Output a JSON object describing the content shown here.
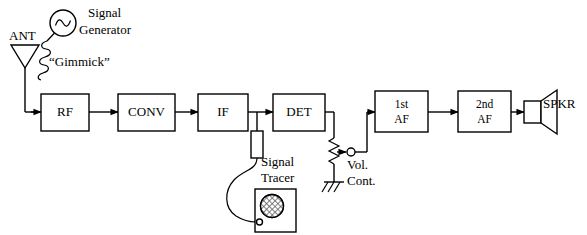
{
  "diagram": {
    "blocks": [
      {
        "id": "rf",
        "label": "RF",
        "label2": "",
        "x": 41,
        "y": 94,
        "w": 48,
        "h": 37
      },
      {
        "id": "conv",
        "label": "CONV",
        "label2": "",
        "x": 118,
        "y": 94,
        "w": 57,
        "h": 37
      },
      {
        "id": "if",
        "label": "IF",
        "label2": "",
        "x": 198,
        "y": 94,
        "w": 50,
        "h": 37
      },
      {
        "id": "det",
        "label": "DET",
        "label2": "",
        "x": 273,
        "y": 94,
        "w": 52,
        "h": 37
      },
      {
        "id": "af1",
        "label": "1st",
        "label2": "AF",
        "x": 375,
        "y": 91,
        "w": 53,
        "h": 41
      },
      {
        "id": "af2",
        "label": "2nd",
        "label2": "AF",
        "x": 458,
        "y": 91,
        "w": 53,
        "h": 41
      }
    ],
    "labels": {
      "antenna": "ANT",
      "signal_generator_line1": "Signal",
      "signal_generator_line2": "Generator",
      "gimmick": "“Gimmick”",
      "signal_tracer_line1": "Signal",
      "signal_tracer_line2": "Tracer",
      "volume_control_line1": "Vol.",
      "volume_control_line2": "Cont.",
      "speaker": "SPKR"
    },
    "icons": {
      "antenna": "antenna-triangle-icon",
      "signal_generator": "sine-wave-oscillator-icon",
      "gimmick": "coil-coupling-icon",
      "probe_resistor": "probe-resistor-icon",
      "signal_tracer": "signal-tracer-instrument-icon",
      "volume_control": "potentiometer-icon",
      "ground": "chassis-ground-icon",
      "speaker": "loudspeaker-icon"
    },
    "colors": {
      "line": "#000000",
      "background": "#ffffff",
      "hatch": "#5a5a5a"
    }
  }
}
